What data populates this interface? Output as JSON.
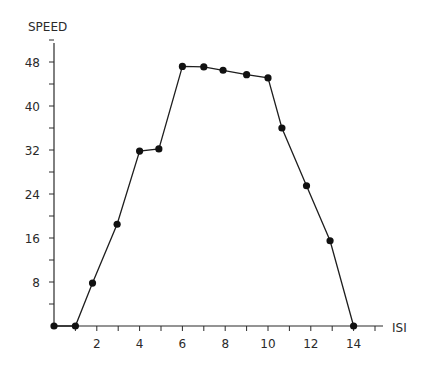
{
  "chart_data": {
    "type": "line",
    "title": "",
    "xlabel": "ISI",
    "ylabel": "SPEED",
    "xlim": [
      0,
      15
    ],
    "ylim": [
      0,
      52
    ],
    "grid": false,
    "legend": null,
    "x_ticks": [
      2,
      4,
      6,
      8,
      10,
      12,
      14
    ],
    "x_minor_ticks": [
      1,
      2,
      3,
      4,
      5,
      6,
      7,
      8,
      9,
      10,
      11,
      12,
      13,
      14,
      15
    ],
    "y_ticks": [
      8,
      16,
      24,
      32,
      40,
      48
    ],
    "y_minor_ticks": [
      4,
      8,
      12,
      16,
      20,
      24,
      28,
      32,
      36,
      40,
      44,
      48,
      52
    ],
    "series": [
      {
        "name": "speed",
        "x": [
          0,
          1,
          1.8,
          2.95,
          4,
          4.9,
          6,
          7,
          7.9,
          9,
          10,
          10.65,
          11.8,
          12.9,
          14
        ],
        "values": [
          0,
          0,
          7.8,
          18.5,
          31.8,
          32.2,
          47.2,
          47.1,
          46.5,
          45.7,
          45.1,
          36,
          25.5,
          15.5,
          0
        ]
      }
    ]
  },
  "labels": {
    "y_axis_title": "SPEED",
    "x_axis_title": "ISI",
    "y_tick_labels": [
      "8",
      "16",
      "24",
      "32",
      "40",
      "48"
    ],
    "x_tick_labels": [
      "2",
      "4",
      "6",
      "8",
      "10",
      "12",
      "14"
    ]
  }
}
